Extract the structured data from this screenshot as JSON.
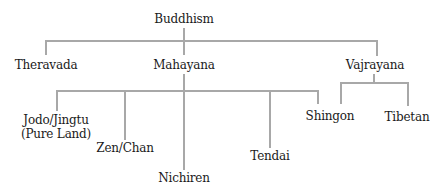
{
  "diagram": {
    "type": "tree",
    "line_color": "#a8a8a8",
    "text_color": "#1a1a1a",
    "root": {
      "label": "Buddhism",
      "children": [
        {
          "label": "Theravada",
          "children": []
        },
        {
          "label": "Mahayana",
          "children": [
            {
              "label": "Jodo/Jingtu",
              "label_line2": "(Pure Land)"
            },
            {
              "label": "Zen/Chan"
            },
            {
              "label": "Nichiren"
            },
            {
              "label": "Tendai"
            },
            {
              "label": "Shingon"
            }
          ]
        },
        {
          "label": "Vajrayana",
          "children": [
            {
              "label": "Shingon"
            },
            {
              "label": "Tibetan"
            }
          ]
        }
      ]
    }
  },
  "nodes": {
    "buddhism": "Buddhism",
    "theravada": "Theravada",
    "mahayana": "Mahayana",
    "vajrayana": "Vajrayana",
    "jodo_line1": "Jodo/Jingtu",
    "jodo_line2": "(Pure Land)",
    "zen": "Zen/Chan",
    "nichiren": "Nichiren",
    "tendai": "Tendai",
    "shingon": "Shingon",
    "tibetan": "Tibetan"
  }
}
